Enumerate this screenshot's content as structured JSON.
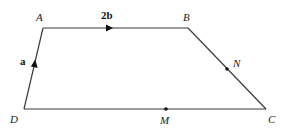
{
  "diagram": {
    "type": "trapezium",
    "vertices": [
      {
        "name": "A",
        "label": "A",
        "x": 43,
        "y": 28,
        "lx": 36,
        "ly": 21
      },
      {
        "name": "B",
        "label": "B",
        "x": 188,
        "y": 28,
        "lx": 183,
        "ly": 21
      },
      {
        "name": "C",
        "label": "C",
        "x": 266,
        "y": 109,
        "lx": 268,
        "ly": 123
      },
      {
        "name": "D",
        "label": "D",
        "x": 24,
        "y": 109,
        "lx": 10,
        "ly": 123
      }
    ],
    "points": [
      {
        "name": "M",
        "label": "M",
        "x": 166,
        "y": 109,
        "lx": 160,
        "ly": 124
      },
      {
        "name": "N",
        "label": "N",
        "x": 227,
        "y": 69,
        "lx": 233,
        "ly": 67
      }
    ],
    "vectors": [
      {
        "name": "a",
        "label": "a",
        "from": "D",
        "to": "A",
        "lx": 20,
        "ly": 65
      },
      {
        "name": "2b",
        "label": "2b",
        "from": "A",
        "to": "B",
        "lx": 101,
        "ly": 19
      }
    ],
    "colors": {
      "line": "#3a3a3a",
      "text": "#222222"
    }
  }
}
